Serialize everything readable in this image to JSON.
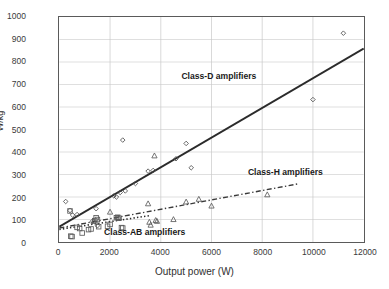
{
  "chart_data": {
    "type": "scatter",
    "title": "",
    "xlabel": "Output power (W)",
    "ylabel": "W/kg",
    "xlim": [
      0,
      12000
    ],
    "ylim": [
      0,
      1000
    ],
    "xticks": [
      0,
      2000,
      4000,
      6000,
      8000,
      10000,
      12000
    ],
    "yticks": [
      0,
      100,
      200,
      300,
      400,
      500,
      600,
      700,
      800,
      900,
      1000
    ],
    "grid": true,
    "legend_position": "in-plot annotations",
    "annotations": [
      {
        "text": "Class-D amplifiers",
        "x": 6250,
        "y": 742
      },
      {
        "text": "Class-H amplifiers",
        "x": 8850,
        "y": 318
      },
      {
        "text": "Class-AB amplifiers",
        "x": 3350,
        "y": 52
      }
    ],
    "series": [
      {
        "name": "Class-D amplifiers",
        "marker": "diamond",
        "color": "#4d4d4d",
        "points": [
          [
            250,
            180
          ],
          [
            420,
            140
          ],
          [
            520,
            120
          ],
          [
            700,
            122
          ],
          [
            1300,
            92
          ],
          [
            1450,
            148
          ],
          [
            1500,
            72
          ],
          [
            2150,
            205
          ],
          [
            2250,
            200
          ],
          [
            2400,
            220
          ],
          [
            2500,
            453
          ],
          [
            2600,
            227
          ],
          [
            3000,
            260
          ],
          [
            3500,
            315
          ],
          [
            3700,
            318
          ],
          [
            4600,
            370
          ],
          [
            5000,
            438
          ],
          [
            5200,
            330
          ],
          [
            10000,
            633
          ],
          [
            11200,
            928
          ]
        ]
      },
      {
        "name": "Class-H amplifiers",
        "marker": "triangle",
        "color": "#5a5a5a",
        "points": [
          [
            1350,
            92
          ],
          [
            2000,
            133
          ],
          [
            2350,
            107
          ],
          [
            3500,
            170
          ],
          [
            3550,
            88
          ],
          [
            3600,
            75
          ],
          [
            3750,
            383
          ],
          [
            3800,
            96
          ],
          [
            3850,
            92
          ],
          [
            4500,
            100
          ],
          [
            5000,
            178
          ],
          [
            5500,
            190
          ],
          [
            6000,
            160
          ],
          [
            8200,
            210
          ]
        ]
      },
      {
        "name": "Class-AB amplifiers",
        "marker": "square",
        "color": "#5a5a5a",
        "points": [
          [
            420,
            138
          ],
          [
            450,
            26
          ],
          [
            500,
            24
          ],
          [
            700,
            65
          ],
          [
            800,
            60
          ],
          [
            900,
            40
          ],
          [
            1150,
            55
          ],
          [
            1250,
            58
          ],
          [
            1400,
            95
          ],
          [
            1450,
            108
          ],
          [
            1500,
            100
          ],
          [
            1550,
            68
          ],
          [
            1900,
            70
          ],
          [
            2000,
            78
          ],
          [
            2250,
            108
          ],
          [
            2300,
            110
          ],
          [
            2350,
            106
          ],
          [
            2450,
            64
          ],
          [
            2500,
            62
          ]
        ]
      }
    ],
    "trendlines": [
      {
        "name": "Class-D trend",
        "style": "solid",
        "width": 2.0,
        "color": "#2b2b2b",
        "x0": 0,
        "y0": 68,
        "x1": 12000,
        "y1": 860
      },
      {
        "name": "Class-H trend",
        "style": "dashdot",
        "width": 1.4,
        "color": "#3a3a3a",
        "x0": 0,
        "y0": 62,
        "x1": 9400,
        "y1": 258
      },
      {
        "name": "Class-AB trend",
        "style": "dotted",
        "width": 1.6,
        "color": "#2b2b2b",
        "x0": 0,
        "y0": 56,
        "x1": 3600,
        "y1": 118
      }
    ]
  }
}
